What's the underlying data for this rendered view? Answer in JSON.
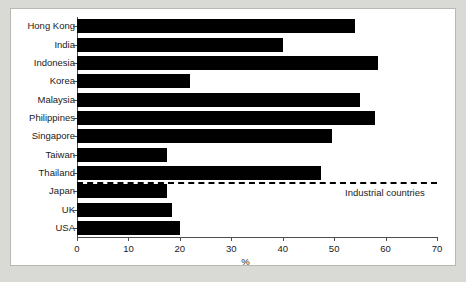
{
  "chart_data": {
    "type": "bar",
    "orientation": "horizontal",
    "title": "",
    "subtitle": "",
    "xlabel": "%",
    "ylabel": "",
    "xlim": [
      0,
      70
    ],
    "xticks": [
      0,
      10,
      20,
      30,
      40,
      50,
      60,
      70
    ],
    "xtick_labels": [
      "0",
      "10",
      "20",
      "30",
      "40",
      "50",
      "60",
      "70"
    ],
    "grid": false,
    "legend": false,
    "bar_color": "#000000",
    "categories": [
      "Hong Kong",
      "India",
      "Indonesia",
      "Korea",
      "Malaysia",
      "Philippines",
      "Singapore",
      "Taiwan",
      "Thailand",
      "Japan",
      "UK",
      "USA"
    ],
    "values": [
      54,
      40,
      58.5,
      22,
      55,
      58,
      49.5,
      17.5,
      47.5,
      17.5,
      18.5,
      20
    ],
    "annotations": [
      {
        "name": "industrial-countries-divider",
        "text": "Industrial countries",
        "type": "dashed-horizontal-line",
        "after_category": "Thailand"
      }
    ]
  },
  "figure": {
    "background_color": "#d9d9d6",
    "panel_color": "#ffffff"
  }
}
